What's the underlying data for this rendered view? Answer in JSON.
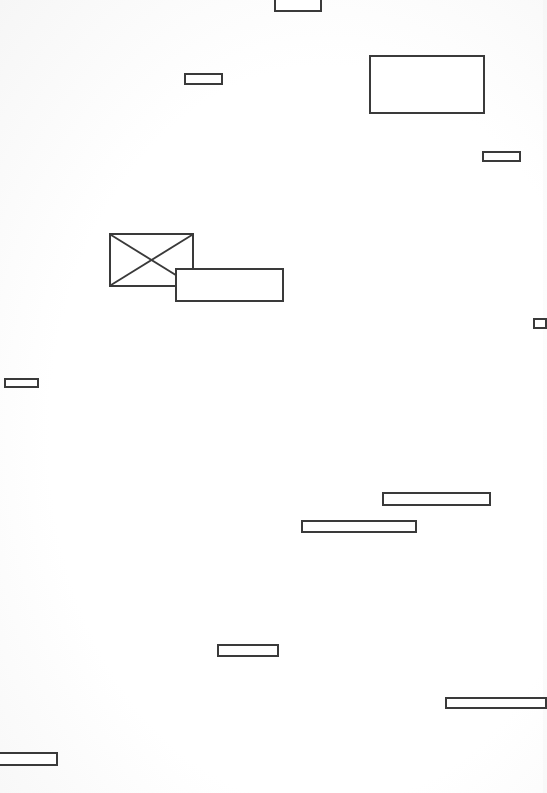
{
  "wireframe": {
    "stroke_color": "#3a3a3a",
    "fill_color": "#ffffff",
    "elements": [
      {
        "id": "top-tab",
        "kind": "box"
      },
      {
        "id": "small-field-1",
        "kind": "box"
      },
      {
        "id": "panel-top-right",
        "kind": "box"
      },
      {
        "id": "small-field-2",
        "kind": "box"
      },
      {
        "id": "image-placeholder",
        "kind": "image"
      },
      {
        "id": "caption-box",
        "kind": "box"
      },
      {
        "id": "edge-handle-right",
        "kind": "box"
      },
      {
        "id": "small-field-left",
        "kind": "box"
      },
      {
        "id": "bar-1",
        "kind": "box"
      },
      {
        "id": "bar-2",
        "kind": "box"
      },
      {
        "id": "small-field-3",
        "kind": "box"
      },
      {
        "id": "bar-bottom-right",
        "kind": "box"
      },
      {
        "id": "bar-bottom-left",
        "kind": "box"
      }
    ]
  }
}
